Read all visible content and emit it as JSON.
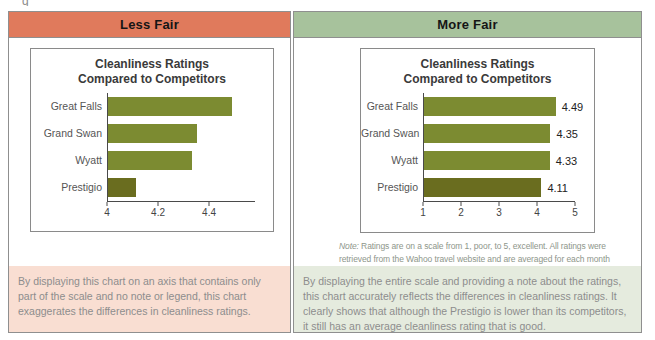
{
  "artifact": {
    "fragment": "g"
  },
  "panels": {
    "left": {
      "header": "Less Fair",
      "header_color": "#e07a5c",
      "box_color": "#f9ded2",
      "explanation": "By displaying this chart on an axis that contains only part of the scale and no note or legend, this chart exaggerates the differences in cleanliness ratings."
    },
    "right": {
      "header": "More Fair",
      "header_color": "#a7c29c",
      "box_color": "#e5ebde",
      "explanation": "By displaying the entire scale and providing a note about the ratings, this chart accurately reflects the differences in cleanliness ratings. It clearly shows that although the Prestigio is lower than its competitors, it still has an average cleanliness rating that is good."
    }
  },
  "colors": {
    "bar": "#7c8b31",
    "bar_highlight": "#6a6d1f",
    "axis": "#4a4a4a",
    "panel_border": "#8f8f8f"
  },
  "chart_data": [
    {
      "type": "bar",
      "orientation": "horizontal",
      "title": "Cleanliness Ratings Compared to Competitors",
      "title_lines": [
        "Cleanliness Ratings",
        "Compared to Competitors"
      ],
      "categories": [
        "Great Falls",
        "Grand Swan",
        "Wyatt",
        "Prestigio"
      ],
      "values": [
        4.49,
        4.35,
        4.33,
        4.11
      ],
      "value_labels_shown": false,
      "xlim": [
        4,
        4.58
      ],
      "xticks": [
        "4",
        "4.2",
        "4.4"
      ],
      "xtick_values": [
        4,
        4.2,
        4.4
      ],
      "bar_color": "#7c8b31",
      "highlight": {
        "index": 3,
        "color": "#6a6d1f"
      },
      "grid": false,
      "legend": false
    },
    {
      "type": "bar",
      "orientation": "horizontal",
      "title": "Cleanliness Ratings Compared to Competitors",
      "title_lines": [
        "Cleanliness Ratings",
        "Compared to Competitors"
      ],
      "categories": [
        "Great Falls",
        "Grand Swan",
        "Wyatt",
        "Prestigio"
      ],
      "values": [
        4.49,
        4.35,
        4.33,
        4.11
      ],
      "value_labels": [
        "4.49",
        "4.35",
        "4.33",
        "4.11"
      ],
      "value_labels_shown": true,
      "xlim": [
        1,
        5
      ],
      "xticks": [
        "1",
        "2",
        "3",
        "4",
        "5"
      ],
      "xtick_values": [
        1,
        2,
        3,
        4,
        5
      ],
      "bar_color": "#7c8b31",
      "highlight": {
        "index": 3,
        "color": "#6a6d1f"
      },
      "grid": false,
      "legend": false,
      "note_prefix": "Note:",
      "note_text": "Ratings are on a scale from 1, poor, to 5, excellent. All ratings were retrieved from the Wahoo travel website and are averaged for each month across the year."
    }
  ]
}
